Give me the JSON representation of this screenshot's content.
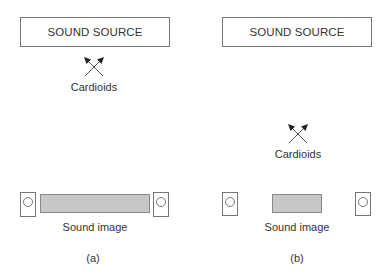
{
  "panels": [
    {
      "id": "a",
      "source_label": "SOUND SOURCE",
      "microphone_label": "Cardioids",
      "image_label": "Sound image",
      "caption": "(a)"
    },
    {
      "id": "b",
      "source_label": "SOUND SOURCE",
      "microphone_label": "Cardioids",
      "image_label": "Sound image",
      "caption": "(b)"
    }
  ],
  "colors": {
    "stroke": "#777777",
    "image_fill": "#c8c8c8",
    "text": "#333333"
  },
  "icons": {
    "microphone_pair": "crossed-arrows-x",
    "loudspeaker": "box-with-circle"
  }
}
